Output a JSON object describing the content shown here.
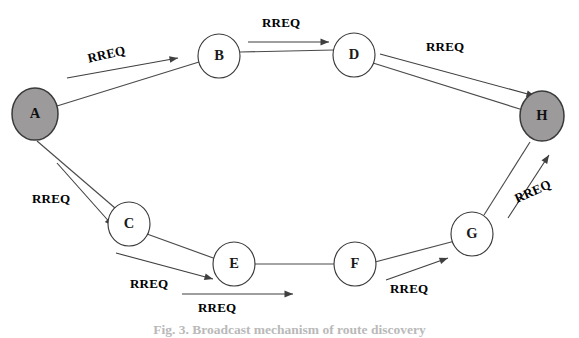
{
  "figure": {
    "caption": "Fig. 3. Broadcast mechanism of route discovery",
    "background_color": "#ffffff",
    "edge_color": "#4a4a4a",
    "filled_node_color": "#9c9a9a",
    "open_node_color": "#ffffff"
  },
  "nodes": [
    {
      "id": "A",
      "label": "A",
      "cx": 35,
      "cy": 114,
      "rx": 23,
      "ry": 26,
      "style": "filled"
    },
    {
      "id": "B",
      "label": "B",
      "cx": 219,
      "cy": 56,
      "rx": 21,
      "ry": 22,
      "style": "open"
    },
    {
      "id": "D",
      "label": "D",
      "cx": 354,
      "cy": 55,
      "rx": 21,
      "ry": 22,
      "style": "open"
    },
    {
      "id": "H",
      "label": "H",
      "cx": 542,
      "cy": 116,
      "rx": 22,
      "ry": 25,
      "style": "filled"
    },
    {
      "id": "C",
      "label": "C",
      "cx": 129,
      "cy": 224,
      "rx": 21,
      "ry": 22,
      "style": "open"
    },
    {
      "id": "E",
      "label": "E",
      "cx": 234,
      "cy": 264,
      "rx": 21,
      "ry": 22,
      "style": "open"
    },
    {
      "id": "F",
      "label": "F",
      "cx": 355,
      "cy": 264,
      "rx": 21,
      "ry": 22,
      "style": "open"
    },
    {
      "id": "G",
      "label": "G",
      "cx": 472,
      "cy": 234,
      "rx": 21,
      "ry": 22,
      "style": "open"
    }
  ],
  "edges": [
    {
      "from": "A",
      "to": "B",
      "x1": 57,
      "y1": 106,
      "x2": 199,
      "y2": 62
    },
    {
      "from": "B",
      "to": "D",
      "x1": 240,
      "y1": 52,
      "x2": 334,
      "y2": 50
    },
    {
      "from": "D",
      "to": "H",
      "x1": 373,
      "y1": 63,
      "x2": 523,
      "y2": 110
    },
    {
      "from": "A",
      "to": "C",
      "x1": 37,
      "y1": 141,
      "x2": 115,
      "y2": 208
    },
    {
      "from": "C",
      "to": "E",
      "x1": 147,
      "y1": 234,
      "x2": 216,
      "y2": 259
    },
    {
      "from": "E",
      "to": "F",
      "x1": 255,
      "y1": 264,
      "x2": 334,
      "y2": 264
    },
    {
      "from": "F",
      "to": "G",
      "x1": 375,
      "y1": 262,
      "x2": 455,
      "y2": 241
    },
    {
      "from": "G",
      "to": "H",
      "x1": 484,
      "y1": 215,
      "x2": 530,
      "y2": 142
    }
  ],
  "messages": [
    {
      "id": "rreq-a-b",
      "text": "RREQ",
      "label_x": 86,
      "label_y": 51,
      "label_rotate": -13,
      "arrow": {
        "x1": 67,
        "y1": 78,
        "x2": 178,
        "y2": 58
      }
    },
    {
      "id": "rreq-b-d",
      "text": "RREQ",
      "label_x": 262,
      "label_y": 15,
      "label_rotate": 0,
      "arrow": {
        "x1": 248,
        "y1": 42,
        "x2": 329,
        "y2": 42
      }
    },
    {
      "id": "rreq-d-h",
      "text": "RREQ",
      "label_x": 426,
      "label_y": 39,
      "label_rotate": 0,
      "arrow": {
        "x1": 380,
        "y1": 54,
        "x2": 535,
        "y2": 96
      }
    },
    {
      "id": "rreq-a-c",
      "text": "RREQ",
      "label_x": 32,
      "label_y": 191,
      "label_rotate": 0,
      "arrow": {
        "x1": 57,
        "y1": 163,
        "x2": 113,
        "y2": 226
      }
    },
    {
      "id": "rreq-c-e",
      "text": "RREQ",
      "label_x": 130,
      "label_y": 276,
      "label_rotate": 0,
      "arrow": {
        "x1": 116,
        "y1": 253,
        "x2": 213,
        "y2": 279
      }
    },
    {
      "id": "rreq-e-f",
      "text": "RREQ",
      "label_x": 198,
      "label_y": 300,
      "label_rotate": 0,
      "arrow": {
        "x1": 182,
        "y1": 294,
        "x2": 293,
        "y2": 294
      }
    },
    {
      "id": "rreq-f-g",
      "text": "RREQ",
      "label_x": 390,
      "label_y": 281,
      "label_rotate": 0,
      "arrow": {
        "x1": 386,
        "y1": 280,
        "x2": 448,
        "y2": 258
      }
    },
    {
      "id": "rreq-g-h",
      "text": "RREQ",
      "label_x": 512,
      "label_y": 192,
      "label_rotate": -24,
      "arrow": {
        "x1": 508,
        "y1": 218,
        "x2": 549,
        "y2": 155
      }
    }
  ]
}
